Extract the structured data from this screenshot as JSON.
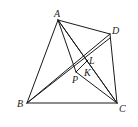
{
  "diagram": {
    "type": "geometry-quadrilateral",
    "points": {
      "A": {
        "label": "A",
        "x": 58,
        "y": 20
      },
      "D": {
        "label": "D",
        "x": 110,
        "y": 34
      },
      "B": {
        "label": "B",
        "x": 27,
        "y": 103
      },
      "C": {
        "label": "C",
        "x": 117,
        "y": 103
      },
      "P": {
        "label": "P",
        "x": 76,
        "y": 72
      },
      "K": {
        "label": "K",
        "x": 84,
        "y": 67
      },
      "L": {
        "label": "L",
        "x": 87,
        "y": 60
      }
    },
    "segments": [
      [
        "A",
        "B"
      ],
      [
        "A",
        "D"
      ],
      [
        "D",
        "C"
      ],
      [
        "B",
        "C"
      ],
      [
        "A",
        "C"
      ],
      [
        "B",
        "D"
      ],
      [
        "A",
        "P"
      ],
      [
        "P",
        "C"
      ],
      [
        "B",
        "L"
      ],
      [
        "A",
        "K"
      ],
      [
        "P",
        "D"
      ]
    ],
    "stroke_color": "#1a1a1a"
  }
}
